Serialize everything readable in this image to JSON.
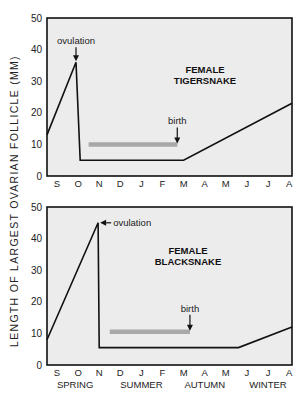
{
  "figure": {
    "ylabel": "LENGTH OF LARGEST OVARIAN FOLLICLE (MM)",
    "months": [
      "S",
      "O",
      "N",
      "D",
      "J",
      "F",
      "M",
      "A",
      "M",
      "J",
      "J",
      "A"
    ],
    "seasons": [
      "SPRING",
      "SUMMER",
      "AUTUMN",
      "WINTER"
    ],
    "colors": {
      "panel_bg": "#ececec",
      "line": "#111111",
      "bar": "#a8a8a8",
      "axis": "#111111"
    }
  },
  "chart_data": [
    {
      "type": "line",
      "title": "FEMALE TIGERSNAKE",
      "title_lines": [
        "FEMALE",
        "TIGERSNAKE"
      ],
      "xlabel": "",
      "ylabel": "LENGTH OF LARGEST OVARIAN FOLLICLE (MM)",
      "ylim": [
        0,
        50
      ],
      "yticks": [
        0,
        10,
        20,
        30,
        40,
        50
      ],
      "categories": [
        "S",
        "O",
        "N",
        "D",
        "J",
        "F",
        "M",
        "A",
        "M",
        "J",
        "J",
        "A"
      ],
      "series": [
        {
          "name": "follicle length",
          "x": [
            -0.5,
            0.9,
            1.1,
            6.0,
            11.5
          ],
          "values": [
            13,
            36,
            5,
            5,
            23
          ]
        }
      ],
      "gestation_bar": {
        "x_start": 1.5,
        "x_end": 5.7,
        "y": 10
      },
      "annotations": [
        {
          "text": "ovulation",
          "x": 0.9,
          "y": 36,
          "arrow": "down"
        },
        {
          "text": "birth",
          "x": 5.7,
          "y": 10,
          "arrow": "down"
        }
      ],
      "grid": false
    },
    {
      "type": "line",
      "title": "FEMALE BLACKSNAKE",
      "title_lines": [
        "FEMALE",
        "BLACKSNAKE"
      ],
      "xlabel": "",
      "ylabel": "LENGTH OF LARGEST OVARIAN FOLLICLE (MM)",
      "ylim": [
        0,
        50
      ],
      "yticks": [
        0,
        10,
        20,
        30,
        40,
        50
      ],
      "categories": [
        "S",
        "O",
        "N",
        "D",
        "J",
        "F",
        "M",
        "A",
        "M",
        "J",
        "J",
        "A"
      ],
      "season_labels": [
        "SPRING",
        "SUMMER",
        "AUTUMN",
        "WINTER"
      ],
      "series": [
        {
          "name": "follicle length",
          "x": [
            -0.5,
            1.95,
            2.0,
            8.6,
            11.5
          ],
          "values": [
            8,
            45,
            5.5,
            5.5,
            12
          ]
        }
      ],
      "gestation_bar": {
        "x_start": 2.5,
        "x_end": 6.3,
        "y": 10.5
      },
      "annotations": [
        {
          "text": "ovulation",
          "x": 1.95,
          "y": 45,
          "arrow": "left"
        },
        {
          "text": "birth",
          "x": 6.3,
          "y": 10.5,
          "arrow": "down"
        }
      ],
      "grid": false
    }
  ]
}
